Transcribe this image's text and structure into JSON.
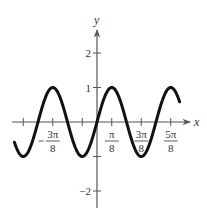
{
  "chart_data": {
    "type": "line",
    "title": "",
    "function": "y = sin(4x)",
    "xlabel": "x",
    "ylabel": "y",
    "xlim": [
      -2.2,
      2.3
    ],
    "ylim": [
      -2.5,
      2.8
    ],
    "x_domain": [
      -2.2,
      2.2
    ],
    "grid": false,
    "legend": null,
    "x_ticks": [
      {
        "value": -1.9635,
        "label": ""
      },
      {
        "value": -1.1781,
        "label_num": "3π",
        "label_den": "8",
        "negative": true
      },
      {
        "value": -0.3927,
        "label": ""
      },
      {
        "value": 0.3927,
        "label_num": "π",
        "label_den": "8",
        "negative": false
      },
      {
        "value": 1.1781,
        "label_num": "3π",
        "label_den": "8",
        "negative": false
      },
      {
        "value": 1.9635,
        "label_num": "5π",
        "label_den": "8",
        "negative": false
      }
    ],
    "y_ticks": [
      {
        "value": 2,
        "label": "2"
      },
      {
        "value": 1,
        "label": "1"
      },
      {
        "value": -1,
        "label": ""
      },
      {
        "value": -2,
        "label": "−2"
      }
    ],
    "series": [
      {
        "name": "sin(4x)",
        "color": "#111111",
        "x": [
          -2.2,
          -1.9635,
          -1.5708,
          -1.1781,
          -0.7854,
          -0.3927,
          0,
          0.3927,
          0.7854,
          1.1781,
          1.5708,
          1.9635,
          2.2
        ],
        "y": [
          -0.59,
          -1,
          0,
          1,
          0,
          -1,
          0,
          1,
          0,
          -1,
          0,
          1,
          0.59
        ]
      }
    ]
  },
  "layout": {
    "origin_px": [
      97,
      122
    ],
    "px_per_x_unit": 37.56,
    "px_per_y_unit": 34.5,
    "axis_color": "#555555",
    "curve_color": "#111111"
  }
}
